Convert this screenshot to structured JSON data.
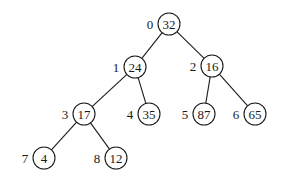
{
  "diagram": {
    "type": "binary-heap-tree",
    "colors": {
      "stroke": "#1a1a1a",
      "background": "#ffffff"
    },
    "node_radius": 11,
    "nodes": [
      {
        "index": "0",
        "value": "32",
        "x": 169,
        "y": 24
      },
      {
        "index": "1",
        "value": "24",
        "x": 135,
        "y": 67
      },
      {
        "index": "2",
        "value": "16",
        "x": 212,
        "y": 66
      },
      {
        "index": "3",
        "value": "17",
        "x": 84,
        "y": 114
      },
      {
        "index": "4",
        "value": "35",
        "x": 149,
        "y": 114
      },
      {
        "index": "5",
        "value": "87",
        "x": 204,
        "y": 114
      },
      {
        "index": "6",
        "value": "65",
        "x": 255,
        "y": 114
      },
      {
        "index": "7",
        "value": "4",
        "x": 44,
        "y": 158
      },
      {
        "index": "8",
        "value": "12",
        "x": 116,
        "y": 158
      }
    ],
    "edges": [
      {
        "from": 0,
        "to": 1
      },
      {
        "from": 0,
        "to": 2
      },
      {
        "from": 1,
        "to": 3
      },
      {
        "from": 1,
        "to": 4
      },
      {
        "from": 2,
        "to": 5
      },
      {
        "from": 2,
        "to": 6
      },
      {
        "from": 3,
        "to": 7
      },
      {
        "from": 3,
        "to": 8
      }
    ]
  }
}
